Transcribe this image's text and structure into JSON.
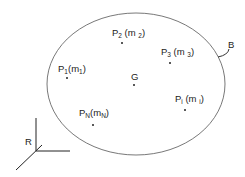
{
  "diagram": {
    "body_label": "B",
    "frame_label": "R",
    "center_label": "G",
    "points": [
      {
        "id": "p2",
        "name": "P",
        "sub": "2",
        "mass": "m",
        "mass_sub": "2"
      },
      {
        "id": "p3",
        "name": "P",
        "sub": "3",
        "mass": "m",
        "mass_sub": "3"
      },
      {
        "id": "p1",
        "name": "P",
        "sub": "1",
        "mass": "m",
        "mass_sub": "1"
      },
      {
        "id": "pi",
        "name": "P",
        "sub": "i",
        "mass": "m",
        "mass_sub": "i"
      },
      {
        "id": "pn",
        "name": "P",
        "sub": "N",
        "mass": "m",
        "mass_sub": "N"
      }
    ],
    "colors": {
      "stroke": "#333333",
      "background": "#ffffff"
    }
  }
}
